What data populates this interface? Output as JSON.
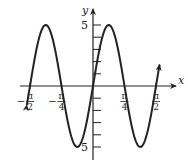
{
  "chart_data": {
    "type": "line",
    "title": "",
    "function": "y = 5 sin(4x)",
    "xlabel": "x",
    "ylabel": "y",
    "xlim": [
      -1.65,
      1.65
    ],
    "ylim": [
      -5.5,
      5.5
    ],
    "x_ticks": [
      {
        "value": -1.5708,
        "label_num": "π",
        "label_den": "2",
        "sign": "−"
      },
      {
        "value": -0.7854,
        "label_num": "π",
        "label_den": "4",
        "sign": "−"
      },
      {
        "value": 0.7854,
        "label_num": "π",
        "label_den": "4",
        "sign": ""
      },
      {
        "value": 1.5708,
        "label_num": "π",
        "label_den": "2",
        "sign": ""
      }
    ],
    "y_ticks": [
      -5,
      -4,
      -3,
      -2,
      -1,
      1,
      2,
      3,
      4,
      5
    ],
    "y_tick_labels": [
      {
        "value": 5,
        "label": "5"
      },
      {
        "value": -5,
        "label": "5"
      }
    ],
    "series": [
      {
        "name": "5 sin 4x",
        "x": [
          -1.65,
          -1.5708,
          -1.1781,
          -0.7854,
          -0.3927,
          0,
          0.3927,
          0.7854,
          1.1781,
          1.5708,
          1.66
        ],
        "y": [
          -1.56,
          0,
          5,
          0,
          -5,
          0,
          5,
          0,
          -5,
          0,
          1.8
        ]
      }
    ],
    "grid": false,
    "legend": null,
    "color": "#222222"
  }
}
